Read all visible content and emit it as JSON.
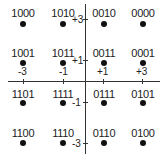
{
  "diagram": {
    "type": "16-QAM constellation",
    "x_ticks": [
      "-3",
      "-1",
      "+1",
      "+3"
    ],
    "y_ticks": [
      "+3",
      "+1",
      "-1",
      "-3"
    ],
    "points": [
      {
        "label": "1000",
        "i": -3,
        "q": 3
      },
      {
        "label": "1010",
        "i": -1,
        "q": 3
      },
      {
        "label": "0010",
        "i": 1,
        "q": 3
      },
      {
        "label": "0000",
        "i": 3,
        "q": 3
      },
      {
        "label": "1001",
        "i": -3,
        "q": 1
      },
      {
        "label": "1011",
        "i": -1,
        "q": 1
      },
      {
        "label": "0011",
        "i": 1,
        "q": 1
      },
      {
        "label": "0001",
        "i": 3,
        "q": 1
      },
      {
        "label": "1101",
        "i": -3,
        "q": -1
      },
      {
        "label": "1111",
        "i": -1,
        "q": -1
      },
      {
        "label": "0111",
        "i": 1,
        "q": -1
      },
      {
        "label": "0101",
        "i": 3,
        "q": -1
      },
      {
        "label": "1100",
        "i": -3,
        "q": -3
      },
      {
        "label": "1110",
        "i": -1,
        "q": -3
      },
      {
        "label": "0110",
        "i": 1,
        "q": -3
      },
      {
        "label": "0100",
        "i": 3,
        "q": -3
      }
    ]
  }
}
